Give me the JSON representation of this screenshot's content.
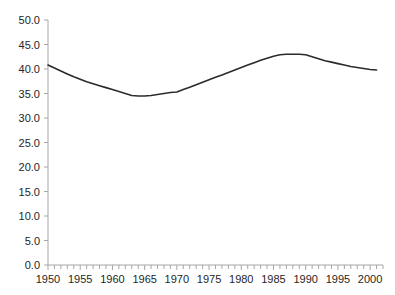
{
  "chart_data": {
    "type": "line",
    "title": "",
    "subtitle": "",
    "xlabel": "",
    "ylabel": "",
    "xlim": [
      1950,
      2002
    ],
    "ylim": [
      0.0,
      50.0
    ],
    "grid": false,
    "legend": null,
    "series_color": "#2b2b2b",
    "axis_color": "#a6a6a6",
    "x": [
      1950,
      1951,
      1952,
      1953,
      1954,
      1955,
      1956,
      1957,
      1958,
      1959,
      1960,
      1961,
      1962,
      1963,
      1964,
      1965,
      1966,
      1967,
      1968,
      1969,
      1970,
      1971,
      1972,
      1973,
      1974,
      1975,
      1976,
      1977,
      1978,
      1979,
      1980,
      1981,
      1982,
      1983,
      1984,
      1985,
      1986,
      1987,
      1988,
      1989,
      1990,
      1991,
      1992,
      1993,
      1994,
      1995,
      1996,
      1997,
      1998,
      1999,
      2000,
      2001
    ],
    "values": [
      40.8,
      40.2,
      39.6,
      39.0,
      38.4,
      37.9,
      37.4,
      37.0,
      36.6,
      36.2,
      35.8,
      35.4,
      35.0,
      34.6,
      34.5,
      34.5,
      34.6,
      34.8,
      35.0,
      35.2,
      35.3,
      35.8,
      36.3,
      36.8,
      37.3,
      37.8,
      38.3,
      38.8,
      39.3,
      39.8,
      40.3,
      40.8,
      41.3,
      41.8,
      42.2,
      42.6,
      42.9,
      43.0,
      43.0,
      43.0,
      42.9,
      42.5,
      42.1,
      41.7,
      41.4,
      41.1,
      40.8,
      40.5,
      40.3,
      40.1,
      39.9,
      39.8
    ],
    "yticks": [
      "0.0",
      "5.0",
      "10.0",
      "15.0",
      "20.0",
      "25.0",
      "30.0",
      "35.0",
      "40.0",
      "45.0",
      "50.0"
    ],
    "ytick_values": [
      0,
      5,
      10,
      15,
      20,
      25,
      30,
      35,
      40,
      45,
      50
    ],
    "xticks": [
      "1950",
      "1955",
      "1960",
      "1965",
      "1970",
      "1975",
      "1980",
      "1985",
      "1990",
      "1995",
      "2000"
    ],
    "xtick_values": [
      1950,
      1955,
      1960,
      1965,
      1970,
      1975,
      1980,
      1985,
      1990,
      1995,
      2000
    ],
    "xminor_step": 1,
    "notes": {
      "start_value": 40.8,
      "minimum_value": 34.5,
      "minimum_years": "1964-1965",
      "peak_value": 43.0,
      "peak_years": "1987-1989",
      "end_value": 39.8
    }
  }
}
